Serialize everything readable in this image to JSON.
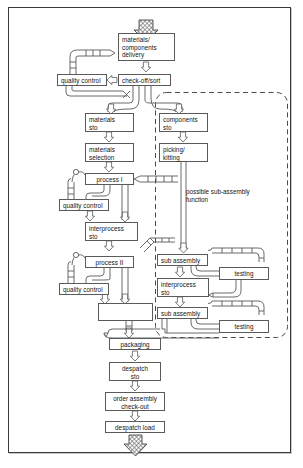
{
  "diagram": {
    "boxes": [
      {
        "id": "materials_components_delivery",
        "label": "materials/\ncomponents\ndelivery",
        "x": 118,
        "y": 33,
        "w": 57,
        "h": 28,
        "align": "left"
      },
      {
        "id": "quality_control_1",
        "label": "quality control",
        "x": 57,
        "y": 74,
        "w": 50,
        "h": 12,
        "align": "left"
      },
      {
        "id": "check_off_sort",
        "label": "check-off/sort",
        "x": 118,
        "y": 74,
        "w": 53,
        "h": 12,
        "align": "left"
      },
      {
        "id": "materials_sto",
        "label": "materials\nsto",
        "x": 85,
        "y": 113,
        "w": 49,
        "h": 19,
        "align": "left"
      },
      {
        "id": "components_sto",
        "label": "components\nsto",
        "x": 159,
        "y": 113,
        "w": 49,
        "h": 19,
        "align": "left"
      },
      {
        "id": "materials_selection",
        "label": "materials\nselection",
        "x": 85,
        "y": 143,
        "w": 49,
        "h": 19,
        "align": "left"
      },
      {
        "id": "picking_kitting",
        "label": "picking/\nkitting",
        "x": 159,
        "y": 143,
        "w": 49,
        "h": 19,
        "align": "left"
      },
      {
        "id": "process_1",
        "label": "process I",
        "x": 85,
        "y": 173,
        "w": 49,
        "h": 12,
        "align": "left"
      },
      {
        "id": "quality_control_2",
        "label": "quality control",
        "x": 59,
        "y": 199,
        "w": 50,
        "h": 12,
        "align": "left"
      },
      {
        "id": "interprocess_sto_1",
        "label": "interprocess\nsto",
        "x": 85,
        "y": 222,
        "w": 53,
        "h": 19,
        "align": "left"
      },
      {
        "id": "process_2",
        "label": "process II",
        "x": 85,
        "y": 256,
        "w": 49,
        "h": 12,
        "align": "left"
      },
      {
        "id": "quality_control_3",
        "label": "quality control",
        "x": 59,
        "y": 283,
        "w": 50,
        "h": 12,
        "align": "left"
      },
      {
        "id": "unlabeled_assembly",
        "label": "",
        "x": 98,
        "y": 303,
        "w": 55,
        "h": 18,
        "align": "left"
      },
      {
        "id": "sub_assembly_1",
        "label": "sub assembly",
        "x": 157,
        "y": 254,
        "w": 51,
        "h": 12,
        "align": "left"
      },
      {
        "id": "testing_1",
        "label": "testing",
        "x": 219,
        "y": 267,
        "w": 50,
        "h": 13,
        "align": "center"
      },
      {
        "id": "interprocess_sto_2",
        "label": "interprocess\nsto",
        "x": 157,
        "y": 278,
        "w": 52,
        "h": 19,
        "align": "left"
      },
      {
        "id": "sub_assembly_2",
        "label": "sub assembly",
        "x": 157,
        "y": 307,
        "w": 51,
        "h": 12,
        "align": "left"
      },
      {
        "id": "testing_2",
        "label": "testing",
        "x": 219,
        "y": 320,
        "w": 50,
        "h": 13,
        "align": "center"
      },
      {
        "id": "packaging",
        "label": "packaging",
        "x": 109,
        "y": 338,
        "w": 52,
        "h": 12,
        "align": "center"
      },
      {
        "id": "despatch_sto",
        "label": "despatch\nsto",
        "x": 109,
        "y": 362,
        "w": 52,
        "h": 19,
        "align": "center"
      },
      {
        "id": "order_assembly_check_out",
        "label": "order assembly\ncheck-out",
        "x": 105,
        "y": 392,
        "w": 60,
        "h": 19,
        "align": "center"
      },
      {
        "id": "despatch_load",
        "label": "despatch load",
        "x": 105,
        "y": 421,
        "w": 60,
        "h": 12,
        "align": "center"
      }
    ],
    "annotations": [
      {
        "id": "possible_sub_assembly_function",
        "label": "possible sub-assembly\nfunction",
        "x": 186,
        "y": 188
      }
    ],
    "dashed_region": {
      "id": "sub-assembly-zone",
      "x": 155,
      "y": 92,
      "w": 133,
      "h": 246
    },
    "input_arrow": {
      "id": "input-goods-arrow",
      "label": ""
    },
    "output_arrow": {
      "id": "output-despatch-arrow",
      "label": ""
    }
  },
  "style": {
    "line_color": "#5a5a5a",
    "text_color": "#121212",
    "frame_color": "#3a3a3a",
    "hatch_color": "#555555",
    "background": "#ffffff"
  }
}
